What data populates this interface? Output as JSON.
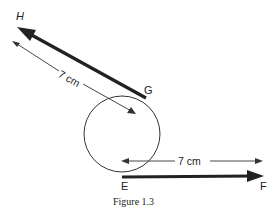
{
  "figure": {
    "caption": "Figure 1.3",
    "labels": {
      "H": "H",
      "G": "G",
      "E": "E",
      "F": "F"
    },
    "measurements": {
      "upper": "7 cm",
      "lower": "7 cm"
    },
    "elements": [
      {
        "type": "circle",
        "description": "circle with tangent vectors"
      },
      {
        "type": "vector",
        "from": "G",
        "to": "H",
        "description": "thick arrow tangent at G pointing to H"
      },
      {
        "type": "vector",
        "from": "E",
        "to": "F",
        "description": "thick arrow tangent at E pointing to F"
      },
      {
        "type": "dimension",
        "label": "7 cm",
        "description": "length of GH"
      },
      {
        "type": "dimension",
        "label": "7 cm",
        "description": "length of EF"
      }
    ],
    "colors": {
      "stroke": "#222222",
      "background": "#ffffff"
    }
  }
}
